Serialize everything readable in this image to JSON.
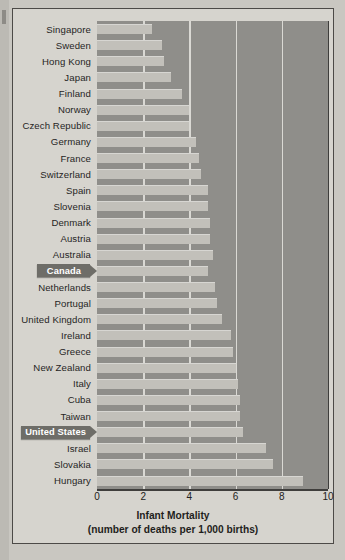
{
  "chart_data": {
    "type": "bar",
    "orientation": "horizontal",
    "title": "Infant Mortality",
    "subtitle": "(number of deaths per 1,000 births)",
    "xlabel": "Infant Mortality (number of deaths per 1,000 births)",
    "ylabel": "",
    "xlim": [
      0,
      10
    ],
    "xticks": [
      "0",
      "2",
      "4",
      "6",
      "8",
      "10"
    ],
    "grid": true,
    "legend": false,
    "highlighted": [
      "Canada",
      "United States"
    ],
    "bar_color": "#c2c0ba",
    "plot_background": "#8f8e8a",
    "highlight_color": "#6e6d68",
    "categories": [
      "Singapore",
      "Sweden",
      "Hong Kong",
      "Japan",
      "Finland",
      "Norway",
      "Czech Republic",
      "Germany",
      "France",
      "Switzerland",
      "Spain",
      "Slovenia",
      "Denmark",
      "Austria",
      "Australia",
      "Canada",
      "Netherlands",
      "Portugal",
      "United Kingdom",
      "Ireland",
      "Greece",
      "New Zealand",
      "Italy",
      "Cuba",
      "Taiwan",
      "United States",
      "Israel",
      "Slovakia",
      "Hungary"
    ],
    "values": [
      2.4,
      2.8,
      2.9,
      3.2,
      3.7,
      4.0,
      4.0,
      4.3,
      4.4,
      4.5,
      4.8,
      4.8,
      4.9,
      4.9,
      5.0,
      4.8,
      5.1,
      5.2,
      5.4,
      5.8,
      5.9,
      6.0,
      6.1,
      6.2,
      6.2,
      6.3,
      7.3,
      7.6,
      8.9
    ]
  },
  "figure": {
    "gridlines": [
      2,
      4,
      6,
      8
    ]
  }
}
